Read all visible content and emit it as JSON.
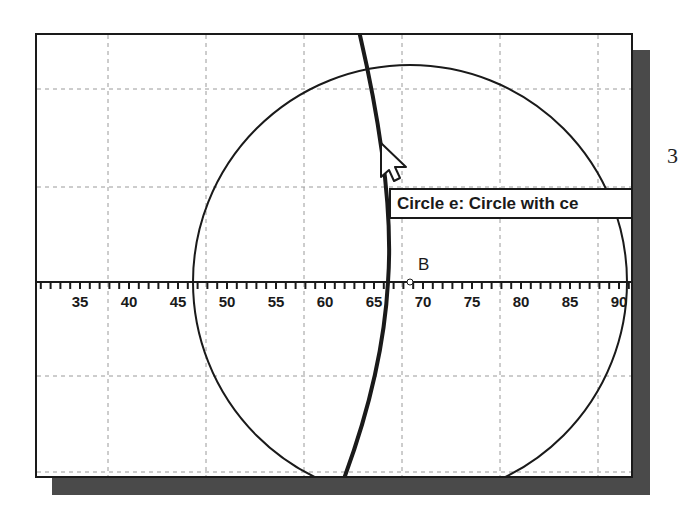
{
  "canvas": {
    "grid": {
      "vertical_x": [
        71,
        169,
        267,
        365,
        463,
        561
      ],
      "horizontal_y": [
        54,
        152,
        341,
        437
      ],
      "color": "#9a9a9a"
    },
    "axis": {
      "y": 247,
      "tick_labels": [
        "35",
        "40",
        "45",
        "50",
        "55",
        "60",
        "65",
        "70",
        "75",
        "80",
        "85",
        "90"
      ],
      "first_label_value": 35,
      "label_step": 5,
      "pixels_per_unit": 9.8,
      "first_label_x": 43
    },
    "objects": {
      "circle_e": {
        "cx": 373,
        "cy": 247,
        "r": 217,
        "stroke": "#1a1a1a"
      },
      "thick_arc": {
        "stroke": "#1a1a1a"
      },
      "point_B": {
        "label": "B",
        "x": 373,
        "y": 247
      }
    },
    "tooltip": {
      "text": "Circle e: Circle with ce"
    }
  },
  "edge_text": "3",
  "colors": {
    "frame": "#1a1a1a",
    "shadow": "#4a4a4a",
    "background": "#ffffff"
  }
}
